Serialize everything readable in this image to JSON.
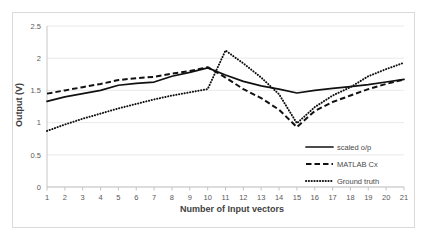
{
  "chart_data": {
    "type": "line",
    "title": "",
    "xlabel": "Number of Input vectors",
    "ylabel": "Output (V)",
    "x": [
      1,
      2,
      3,
      4,
      5,
      6,
      7,
      8,
      9,
      10,
      11,
      12,
      13,
      14,
      15,
      16,
      17,
      18,
      19,
      20,
      21
    ],
    "xticklabels": [
      "1",
      "2",
      "3",
      "4",
      "5",
      "6",
      "7",
      "8",
      "9",
      "10",
      "11",
      "12",
      "13",
      "14",
      "15",
      "16",
      "17",
      "18",
      "19",
      "20",
      "21"
    ],
    "yticklabels": [
      "0",
      "0.5",
      "1",
      "1.5",
      "2",
      "2.5"
    ],
    "yticks": [
      0,
      0.5,
      1,
      1.5,
      2,
      2.5
    ],
    "ylim": [
      0,
      2.5
    ],
    "xlim": [
      1,
      21
    ],
    "grid": true,
    "legend_position": "inside-lower-right",
    "series": [
      {
        "name": "scaled o/p",
        "style": "solid",
        "color": "#111111",
        "values": [
          1.33,
          1.4,
          1.45,
          1.5,
          1.58,
          1.61,
          1.63,
          1.72,
          1.78,
          1.85,
          1.74,
          1.64,
          1.57,
          1.52,
          1.46,
          1.5,
          1.53,
          1.56,
          1.59,
          1.63,
          1.67
        ]
      },
      {
        "name": "MATLAB Cx",
        "style": "dashed",
        "color": "#111111",
        "values": [
          1.45,
          1.5,
          1.55,
          1.6,
          1.66,
          1.69,
          1.71,
          1.76,
          1.8,
          1.86,
          1.7,
          1.52,
          1.38,
          1.2,
          0.93,
          1.18,
          1.32,
          1.42,
          1.52,
          1.6,
          1.67
        ]
      },
      {
        "name": "Ground truth",
        "style": "dotted",
        "color": "#111111",
        "values": [
          0.87,
          0.97,
          1.06,
          1.14,
          1.22,
          1.29,
          1.36,
          1.42,
          1.47,
          1.52,
          2.12,
          1.92,
          1.7,
          1.44,
          0.99,
          1.24,
          1.42,
          1.55,
          1.72,
          1.83,
          1.93
        ]
      }
    ]
  },
  "legend": {
    "items": [
      {
        "label": "scaled o/p"
      },
      {
        "label": "MATLAB Cx"
      },
      {
        "label": "Ground truth"
      }
    ]
  }
}
